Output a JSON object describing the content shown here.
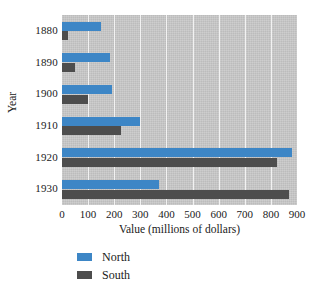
{
  "chart_data": {
    "type": "bar",
    "orientation": "horizontal",
    "title": "",
    "xlabel": "Value (millions of dollars)",
    "ylabel": "Year",
    "categories": [
      "1880",
      "1890",
      "1900",
      "1910",
      "1920",
      "1930"
    ],
    "series": [
      {
        "name": "North",
        "color": "#3d86c6",
        "values": [
          150,
          185,
          190,
          300,
          880,
          370
        ]
      },
      {
        "name": "South",
        "color": "#4d4d4d",
        "values": [
          22,
          50,
          100,
          225,
          825,
          870
        ]
      }
    ],
    "xlim": [
      0,
      900
    ],
    "xticks": [
      0,
      100,
      200,
      300,
      400,
      500,
      600,
      700,
      800,
      900
    ],
    "xtick_labels": [
      "0",
      "100",
      "200",
      "300",
      "400",
      "500",
      "600",
      "700",
      "800",
      "900"
    ],
    "grid": true,
    "grid_axis": "x",
    "grid_color": "#f2f2f2",
    "plot_background": "#c9c9c9",
    "legend_position": "bottom-left",
    "legend_entries": [
      "North",
      "South"
    ]
  }
}
